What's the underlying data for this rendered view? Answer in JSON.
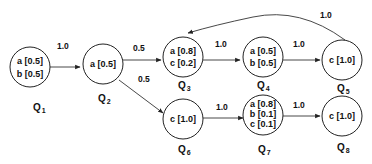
{
  "diagram": {
    "nodes": [
      {
        "id": "Q1",
        "name": "Q",
        "sub": "1",
        "lines": [
          "a [0.5]",
          "b [0.5]"
        ]
      },
      {
        "id": "Q2",
        "name": "Q",
        "sub": "2",
        "lines": [
          "a [0.5]"
        ]
      },
      {
        "id": "Q3",
        "name": "Q",
        "sub": "3",
        "lines": [
          "a [0.8]",
          "c [0.2]"
        ]
      },
      {
        "id": "Q4",
        "name": "Q",
        "sub": "4",
        "lines": [
          "a [0.5]",
          "b [0.5]"
        ]
      },
      {
        "id": "Q5",
        "name": "Q",
        "sub": "5",
        "lines": [
          "c [1.0]"
        ]
      },
      {
        "id": "Q6",
        "name": "Q",
        "sub": "6",
        "lines": [
          "c [1.0]"
        ]
      },
      {
        "id": "Q7",
        "name": "Q",
        "sub": "7",
        "lines": [
          "a [0.8]",
          "b [0.1]",
          "c [0.1]"
        ]
      },
      {
        "id": "Q8",
        "name": "Q",
        "sub": "8",
        "lines": [
          "c [1.0]"
        ]
      }
    ],
    "edges": [
      {
        "from": "Q1",
        "to": "Q2",
        "label": "1.0"
      },
      {
        "from": "Q2",
        "to": "Q3",
        "label": "0.5"
      },
      {
        "from": "Q2",
        "to": "Q6",
        "label": "0.5"
      },
      {
        "from": "Q3",
        "to": "Q4",
        "label": "1.0"
      },
      {
        "from": "Q4",
        "to": "Q5",
        "label": "1.0"
      },
      {
        "from": "Q5",
        "to": "Q3",
        "label": "1.0"
      },
      {
        "from": "Q6",
        "to": "Q7",
        "label": "1.0"
      },
      {
        "from": "Q7",
        "to": "Q8",
        "label": "1.0"
      }
    ]
  }
}
